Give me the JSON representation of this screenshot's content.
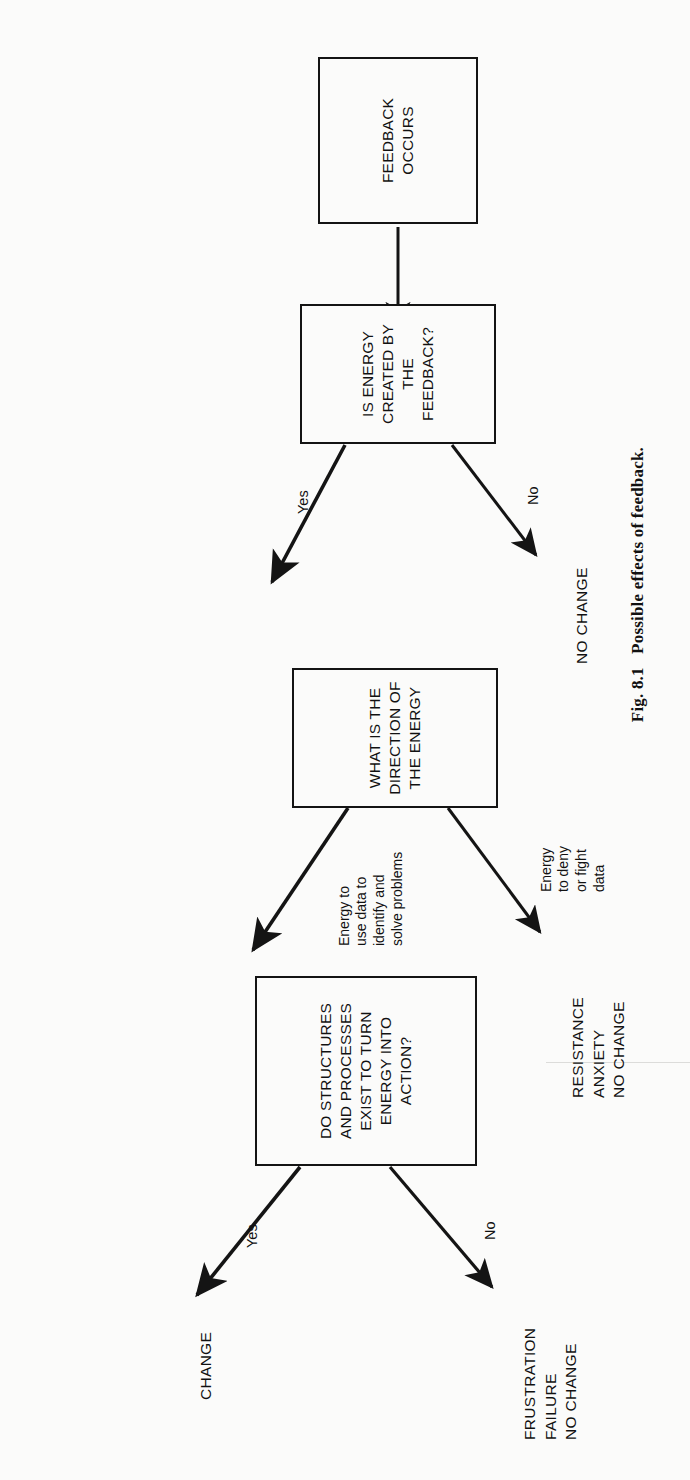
{
  "figure": {
    "caption": "Fig. 8.1   Possible effects of feedback.",
    "caption_number": "Fig. 8.1",
    "caption_text": "Possible effects of feedback."
  },
  "nodes": {
    "start": {
      "id": "feedback-occurs",
      "label": "FEEDBACK\nOCCURS",
      "type": "process"
    },
    "decision1": {
      "id": "is-energy-created",
      "label": "IS ENERGY\nCREATED BY\nTHE FEEDBACK?",
      "type": "decision"
    },
    "decision2": {
      "id": "direction-of-energy",
      "label": "WHAT IS THE\nDIRECTION OF\nTHE ENERGY",
      "type": "decision"
    },
    "decision3": {
      "id": "structures-and-processes",
      "label": "DO STRUCTURES\nAND PROCESSES\nEXIST TO TURN\nENERGY INTO\nACTION?",
      "type": "decision"
    }
  },
  "outcomes": {
    "no_change": {
      "id": "no-change",
      "label": "NO  CHANGE"
    },
    "resistance": {
      "id": "resistance-anxiety-no-change",
      "label": "RESISTANCE\nANXIETY\nNO CHANGE"
    },
    "change": {
      "id": "change",
      "label": "CHANGE"
    },
    "frustration": {
      "id": "frustration-failure-no-change",
      "label": "FRUSTRATION\nFAILURE\nNO CHANGE"
    }
  },
  "edges": {
    "start_to_d1": {
      "label": ""
    },
    "d1_yes": {
      "label": "Yes"
    },
    "d1_no": {
      "label": "No"
    },
    "d2_use_data": {
      "label": "Energy to\nuse data to\nidentify and\nsolve problems"
    },
    "d2_deny": {
      "label": "Energy\nto deny\nor fight\ndata"
    },
    "d3_yes": {
      "label": "Yes"
    },
    "d3_no": {
      "label": "No"
    }
  },
  "colors": {
    "ink": "#141414",
    "paper": "#fbfbfa"
  }
}
